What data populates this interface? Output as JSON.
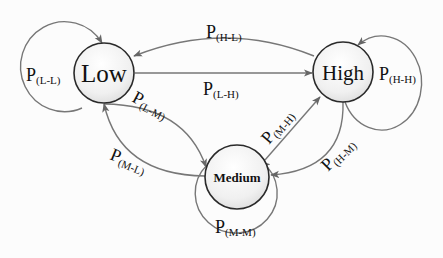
{
  "diagram": {
    "type": "state-transition",
    "colors": {
      "edge": "#777777",
      "node_border": "#2a2a2a",
      "node_fill_light": "#ffffff",
      "node_fill_dark": "#dcdcdc",
      "text": "#111111"
    },
    "nodes": [
      {
        "id": "low",
        "label": "Low"
      },
      {
        "id": "high",
        "label": "High"
      },
      {
        "id": "medium",
        "label": "Medium"
      }
    ],
    "edges": [
      {
        "from": "low",
        "to": "low",
        "label_main": "P",
        "label_sub": "(L-L)"
      },
      {
        "from": "high",
        "to": "low",
        "label_main": "P",
        "label_sub": "(H-L)"
      },
      {
        "from": "low",
        "to": "high",
        "label_main": "P",
        "label_sub": "(L-H)"
      },
      {
        "from": "high",
        "to": "high",
        "label_main": "P",
        "label_sub": "(H-H)"
      },
      {
        "from": "low",
        "to": "medium",
        "label_main": "P",
        "label_sub": "(L-M)"
      },
      {
        "from": "medium",
        "to": "low",
        "label_main": "P",
        "label_sub": "(M-L)"
      },
      {
        "from": "medium",
        "to": "high",
        "label_main": "P",
        "label_sub": "(M-H)"
      },
      {
        "from": "high",
        "to": "medium",
        "label_main": "P",
        "label_sub": "(H-M)"
      },
      {
        "from": "medium",
        "to": "medium",
        "label_main": "P",
        "label_sub": "(M-M)"
      }
    ]
  }
}
